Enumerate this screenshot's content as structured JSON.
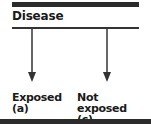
{
  "diagram": {
    "title": "Disease",
    "branches": [
      {
        "label": "Exposed",
        "code": "(a)"
      },
      {
        "label": "Not exposed",
        "code": "(c)"
      }
    ]
  }
}
